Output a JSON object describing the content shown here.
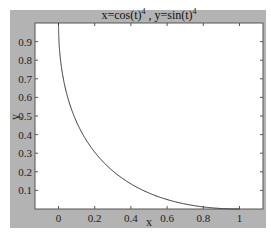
{
  "chart_data": {
    "type": "line",
    "title_display": {
      "base1": "x=cos(t)",
      "sup1": "4",
      "mid": " , y=sin(t)",
      "sup2": "4"
    },
    "xlabel": "x",
    "ylabel": "y",
    "xlim": [
      -0.13,
      1.13
    ],
    "ylim": [
      0,
      1.0
    ],
    "xticks": [
      "0",
      "0.2",
      "0.4",
      "0.6",
      "0.8",
      "1"
    ],
    "yticks": [
      "0.1",
      "0.2",
      "0.3",
      "0.4",
      "0.5",
      "0.6",
      "0.7",
      "0.8",
      "0.9"
    ],
    "grid": false,
    "legend": null,
    "series": [
      {
        "name": "parametric curve",
        "equation": "x=cos(t)^4, y=sin(t)^4",
        "t_range": [
          0,
          1.5708
        ],
        "color": "#333333"
      }
    ]
  },
  "colors": {
    "figure_bg": "#b3b3b3",
    "axes_bg": "#ffffff",
    "line": "#333333"
  }
}
